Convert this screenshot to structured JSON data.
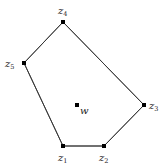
{
  "diagram": {
    "title": "",
    "polygon_order": [
      "z1",
      "z2",
      "z3",
      "z4",
      "z5"
    ],
    "vertices": [
      {
        "id": "z1",
        "name": "z",
        "sub": "1",
        "label_pos": "below"
      },
      {
        "id": "z2",
        "name": "z",
        "sub": "2",
        "label_pos": "below"
      },
      {
        "id": "z3",
        "name": "z",
        "sub": "3",
        "label_pos": "right"
      },
      {
        "id": "z4",
        "name": "z",
        "sub": "4",
        "label_pos": "above"
      },
      {
        "id": "z5",
        "name": "z",
        "sub": "5",
        "label_pos": "left"
      }
    ],
    "interior_point": {
      "id": "w",
      "name": "w",
      "label_pos": "below-right"
    },
    "colors": {
      "edge": "#333333",
      "point": "#000000",
      "text": "#222222"
    }
  }
}
